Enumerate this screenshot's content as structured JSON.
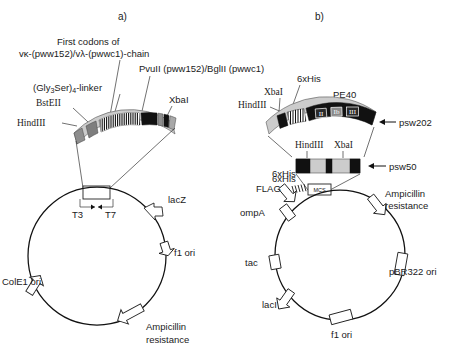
{
  "figure": {
    "panels": [
      {
        "id": "a",
        "title": "a)",
        "construct_labels": [
          {
            "name": "hindiii-left",
            "text": "HindIII"
          },
          {
            "name": "bstell",
            "text": "BstEII"
          },
          {
            "name": "gly3ser-linker",
            "text": "(Gly3Ser)4-linker"
          },
          {
            "name": "first-codons-line1",
            "text": "First codons of"
          },
          {
            "name": "first-codons-line2",
            "text": "vκ-(pww152)/vλ-(pwwc1)-chain"
          },
          {
            "name": "pvuii-bglii",
            "text": "PvuII (pww152)/BglII (pwwc1)"
          },
          {
            "name": "xbai-right",
            "text": "XbaI"
          }
        ],
        "promoters": [
          {
            "name": "t3-promoter",
            "text": "T3"
          },
          {
            "name": "t7-promoter",
            "text": "T7"
          }
        ],
        "plasmid_features": [
          {
            "name": "lacz",
            "text": "lacZ"
          },
          {
            "name": "f1-ori",
            "text": "f1 ori"
          },
          {
            "name": "ampicillin-resistance",
            "text": "Ampicillin\nresistance",
            "line1": "Ampicillin",
            "line2": "resistance"
          },
          {
            "name": "cole1-ori",
            "text": "ColE1 ori"
          }
        ]
      },
      {
        "id": "b",
        "title": "b)",
        "psw202": {
          "name": "psw202-construct",
          "arrow_label": "psw202",
          "labels": [
            {
              "name": "hindiii",
              "text": "HindIII"
            },
            {
              "name": "xbai",
              "text": "XbaI"
            },
            {
              "name": "6xhis",
              "text": "6xHis"
            },
            {
              "name": "pe40",
              "text": "PE40"
            }
          ],
          "domains": [
            "II",
            "Ib",
            "III"
          ]
        },
        "psw50": {
          "name": "psw50-construct",
          "arrow_label": "psw50",
          "labels": [
            {
              "name": "hindiii",
              "text": "HindIII"
            },
            {
              "name": "xbai",
              "text": "XbaI"
            },
            {
              "name": "6xhis",
              "text": "6xHis"
            }
          ]
        },
        "mcs": {
          "name": "mcs-box",
          "text": "MCS"
        },
        "plasmid_features": [
          {
            "name": "6xhis",
            "text": "6xHis"
          },
          {
            "name": "flag",
            "text": "FLAG"
          },
          {
            "name": "ompa",
            "text": "ompA"
          },
          {
            "name": "tac",
            "text": "tac"
          },
          {
            "name": "laci",
            "text": "lacI"
          },
          {
            "name": "f1-ori",
            "text": "f1 ori"
          },
          {
            "name": "pbr322-ori",
            "text": "pBR322 ori"
          },
          {
            "name": "ampicillin-resistance",
            "line1": "Ampicillin",
            "line2": "resistance"
          }
        ]
      }
    ]
  },
  "colors": {
    "black": "#111111",
    "gray": "#9a9a9a",
    "light_gray": "#cbcbcb",
    "white": "#ffffff",
    "stroke": "#222222"
  }
}
